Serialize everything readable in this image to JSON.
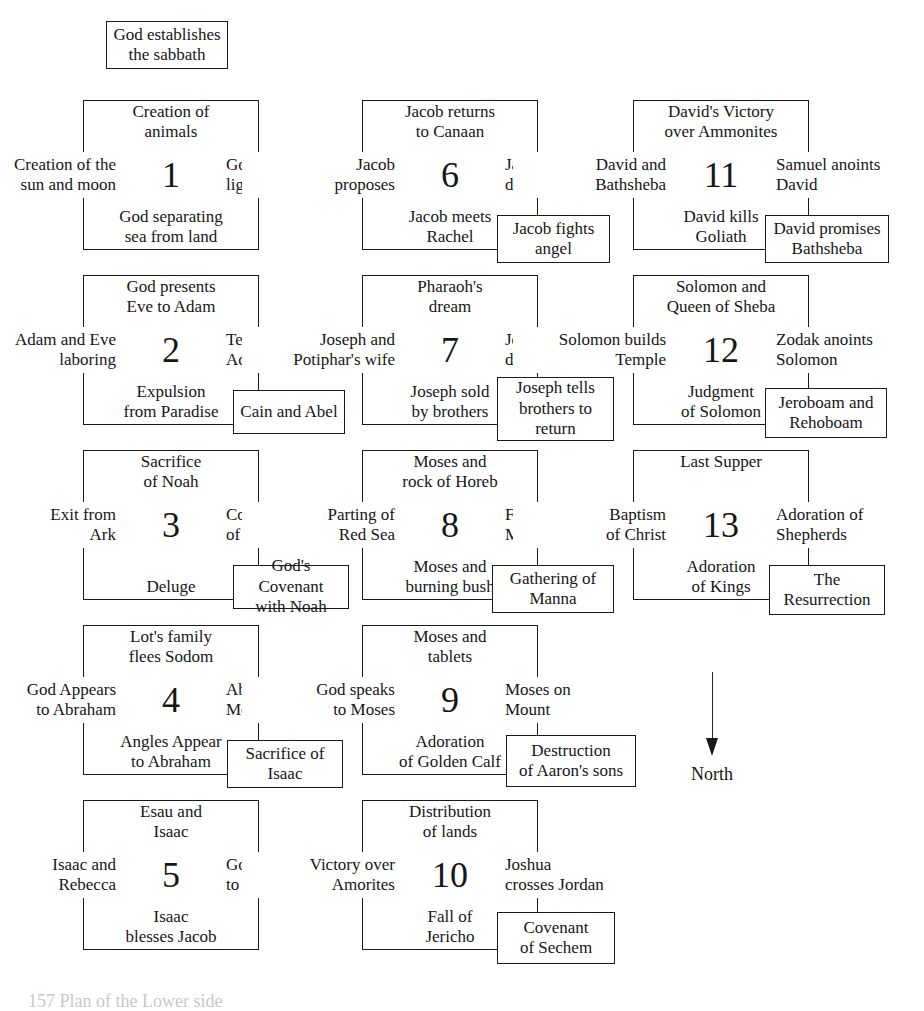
{
  "diagram": {
    "title_box": {
      "label": "God establishes\nthe sabbath",
      "line1": "God establishes",
      "line2": "the sabbath"
    },
    "north_indicator": {
      "label": "North",
      "direction": "down"
    },
    "caption": "157 Plan of the Lower side",
    "panels": [
      {
        "number": "1",
        "north": "Creation of\nanimals",
        "west": "Creation of the\nsun and moon",
        "east": "God separating\nlight from dark",
        "south": "God separating\nsea from land",
        "sub": null
      },
      {
        "number": "2",
        "north": "God presents\nEve to Adam",
        "west": "Adam and Eve\nlaboring",
        "east": "Temptation of\nAdam and Eve",
        "south": "Expulsion\nfrom Paradise",
        "sub": "Cain and Abel"
      },
      {
        "number": "3",
        "north": "Sacrifice\nof Noah",
        "west": "Exit from\nArk",
        "east": "Construction\nof the Ark",
        "south": "Deluge",
        "sub": "God's Covenant\nwith Noah"
      },
      {
        "number": "4",
        "north": "Lot's family\nflees Sodom",
        "west": "God Appears\nto Abraham",
        "east": "Abraham and\nMelchisedek",
        "south": "Angles Appear\nto Abraham",
        "sub": "Sacrifice of\nIsaac"
      },
      {
        "number": "5",
        "north": "Esau and\nIsaac",
        "west": "Isaac and\nRebecca",
        "east": "God appears\nto Isaac",
        "south": "Isaac\nblesses Jacob",
        "sub": null
      },
      {
        "number": "6",
        "north": "Jacob returns\nto Canaan",
        "west": "Jacob\nproposes",
        "east": "Jacob's\ndream",
        "south": "Jacob meets\nRachel",
        "sub": "Jacob fights\nangel"
      },
      {
        "number": "7",
        "north": "Pharaoh's\ndream",
        "west": "Joseph and\nPotiphar's wife",
        "east": "Joseph's\ndream",
        "south": "Joseph sold\nby brothers",
        "sub": "Joseph tells\nbrothers to\nreturn"
      },
      {
        "number": "8",
        "north": "Moses and\nrock of Horeb",
        "west": "Parting of\nRed Sea",
        "east": "Finding of\nMoses",
        "south": "Moses and\nburning bush",
        "sub": "Gathering of\nManna"
      },
      {
        "number": "9",
        "north": "Moses and\ntablets",
        "west": "God speaks\nto Moses",
        "east": "Moses on\nMount",
        "south": "Adoration\nof Golden Calf",
        "sub": "Destruction\nof Aaron's sons"
      },
      {
        "number": "10",
        "north": "Distribution\nof lands",
        "west": "Victory over\nAmorites",
        "east": "Joshua\ncrosses Jordan",
        "south": "Fall of\nJericho",
        "sub": "Covenant\nof Sechem"
      },
      {
        "number": "11",
        "north": "David's Victory\nover Ammonites",
        "west": "David and\nBathsheba",
        "east": "Samuel anoints\nDavid",
        "south": "David kills\nGoliath",
        "sub": "David promises\nBathsheba"
      },
      {
        "number": "12",
        "north": "Solomon and\nQueen of Sheba",
        "west": "Solomon builds\nTemple",
        "east": "Zodak anoints\nSolomon",
        "south": "Judgment\nof Solomon",
        "sub": "Jeroboam and\nRehoboam"
      },
      {
        "number": "13",
        "north": "Last Supper",
        "west": "Baptism\nof Christ",
        "east": "Adoration of\nShepherds",
        "south": "Adoration\nof Kings",
        "sub": "The\nResurrection"
      }
    ]
  },
  "style": {
    "ink": "#1a1a1a",
    "paper": "#ffffff"
  }
}
